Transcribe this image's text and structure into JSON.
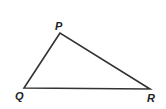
{
  "diagram": {
    "type": "triangle",
    "stroke_color": "#333333",
    "vertices": [
      {
        "label": "P",
        "x": 60,
        "y": 33,
        "label_x": 55,
        "label_y": 30
      },
      {
        "label": "Q",
        "x": 24,
        "y": 88,
        "label_x": 15,
        "label_y": 100
      },
      {
        "label": "R",
        "x": 150,
        "y": 89,
        "label_x": 147,
        "label_y": 102
      }
    ]
  }
}
